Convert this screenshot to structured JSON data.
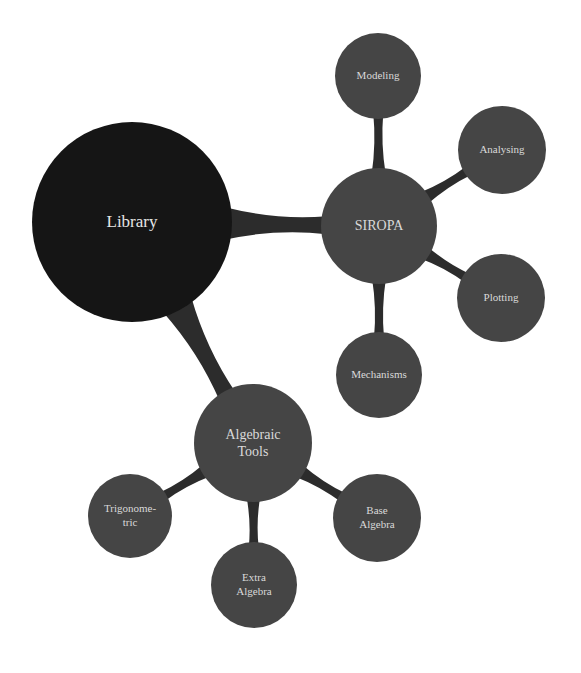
{
  "diagram": {
    "type": "mindmap",
    "colors": {
      "background": "#ffffff",
      "root_fill": "#151515",
      "child_fill": "#454545",
      "connector": "#2c2c2c",
      "label": "#d9d9d9"
    },
    "root": {
      "id": "library",
      "label": "Library",
      "cx": 132,
      "cy": 222,
      "r": 100
    },
    "children": [
      {
        "id": "siropa",
        "label": "SIROPA",
        "cx": 379,
        "cy": 226,
        "r": 58,
        "children": [
          {
            "id": "modeling",
            "label": "Modeling",
            "cx": 378,
            "cy": 76,
            "r": 43
          },
          {
            "id": "analysing",
            "label": "Analysing",
            "cx": 502,
            "cy": 150,
            "r": 44
          },
          {
            "id": "plotting",
            "label": "Plotting",
            "cx": 501,
            "cy": 298,
            "r": 44
          },
          {
            "id": "mechanisms",
            "label": "Mechanisms",
            "cx": 379,
            "cy": 375,
            "r": 43
          }
        ]
      },
      {
        "id": "algebraic-tools",
        "label": "Algebraic Tools",
        "label_lines": [
          "Algebraic",
          "Tools"
        ],
        "cx": 253,
        "cy": 443,
        "r": 59,
        "children": [
          {
            "id": "trigonometric",
            "label": "Trigonometric",
            "label_lines": [
              "Trigonome-",
              "tric"
            ],
            "cx": 130,
            "cy": 516,
            "r": 42
          },
          {
            "id": "base-algebra",
            "label": "Base Algebra",
            "label_lines": [
              "Base",
              "Algebra"
            ],
            "cx": 377,
            "cy": 518,
            "r": 44
          },
          {
            "id": "extra-algebra",
            "label": "Extra Algebra",
            "label_lines": [
              "Extra",
              "Algebra"
            ],
            "cx": 254,
            "cy": 585,
            "r": 43
          }
        ]
      }
    ]
  }
}
